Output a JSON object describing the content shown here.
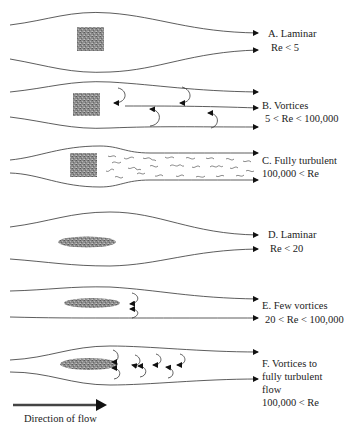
{
  "diagram": {
    "panels": [
      {
        "id": "A",
        "title": "A. Laminar",
        "condition": "Re < 5",
        "body": "square",
        "regime": "laminar"
      },
      {
        "id": "B",
        "title": "B. Vortices",
        "condition": "5 < Re < 100,000",
        "body": "square",
        "regime": "vortices"
      },
      {
        "id": "C",
        "title": "C. Fully turbulent",
        "condition": "100,000 < Re",
        "body": "square",
        "regime": "turbulent"
      },
      {
        "id": "D",
        "title": "D. Laminar",
        "condition": "Re < 20",
        "body": "ellipse",
        "regime": "laminar"
      },
      {
        "id": "E",
        "title": "E. Few vortices",
        "condition": "20 < Re < 100,000",
        "body": "ellipse",
        "regime": "few-vortices"
      },
      {
        "id": "F",
        "title_lines": [
          "F. Vortices to",
          "fully turbulent",
          "flow"
        ],
        "condition": "100,000 < Re",
        "body": "ellipse",
        "regime": "vortices-to-turbulent"
      }
    ],
    "legend": {
      "label": "Direction of flow",
      "icon": "right-arrow-icon"
    },
    "colors": {
      "line": "#333333",
      "body_fill": "#8a8a8a",
      "arrow": "#111111"
    }
  }
}
